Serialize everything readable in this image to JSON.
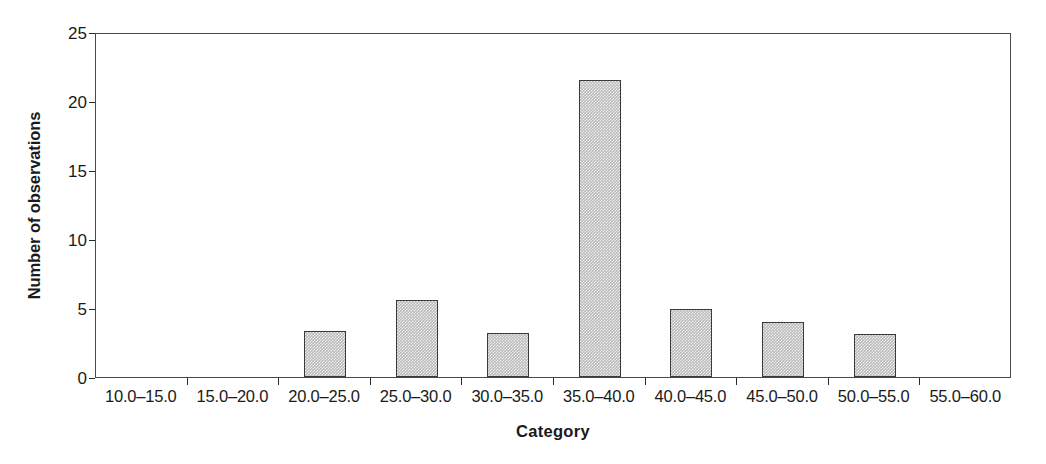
{
  "chart_data": {
    "type": "bar",
    "title": "",
    "subtitle": "",
    "xlabel": "Category",
    "ylabel": "Number of observations",
    "categories": [
      "10.0–15.0",
      "15.0–20.0",
      "20.0–25.0",
      "25.0–30.0",
      "30.0–35.0",
      "35.0–40.0",
      "40.0–45.0",
      "45.0–50.0",
      "50.0–55.0",
      "55.0–60.0"
    ],
    "values": [
      0,
      0,
      3.3,
      5.6,
      3.2,
      21.5,
      4.9,
      4.0,
      3.1,
      0
    ],
    "ylim": [
      0,
      25
    ],
    "yticks": [
      0,
      5,
      10,
      15,
      20,
      25
    ],
    "ytick_labels": [
      "0",
      "5",
      "10",
      "15",
      "20",
      "25"
    ],
    "grid": false,
    "legend": null,
    "legend_position": "none",
    "bar_fill_color": "#b9b9b9",
    "bar_edge_color": "#3a3a3a",
    "axis_color": "#4a4a4a",
    "background_color": "#ffffff",
    "text_color": "#1a1a1a",
    "annotations": []
  }
}
